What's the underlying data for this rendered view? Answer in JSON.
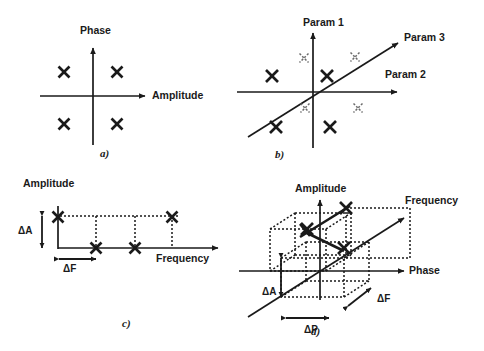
{
  "figure": {
    "width": 484,
    "height": 351,
    "background": "#ffffff",
    "ink_color": "#1a1a1a",
    "faint_color": "#6b6b6b"
  },
  "panels": [
    {
      "id": "a",
      "label": "a)",
      "label_pos": {
        "x": 100,
        "y": 157
      },
      "caption": "Two-dimensional Amplitude-Phase constellation with four bold symbol points",
      "origin": {
        "x": 93,
        "y": 96
      },
      "axes": [
        {
          "name": "horizontal-axis",
          "label": "Amplitude",
          "label_pos": {
            "x": 152,
            "y": 99
          },
          "from": {
            "x": 40,
            "y": 96
          },
          "to": {
            "x": 145,
            "y": 96
          },
          "arrow": true
        },
        {
          "name": "vertical-axis",
          "label": "Phase",
          "label_pos": {
            "x": 80,
            "y": 34
          },
          "from": {
            "x": 93,
            "y": 145
          },
          "to": {
            "x": 93,
            "y": 48
          },
          "arrow": true
        }
      ],
      "markers": [
        {
          "x": 64,
          "y": 72,
          "style": "bold",
          "size": 11
        },
        {
          "x": 117,
          "y": 72,
          "style": "bold",
          "size": 11
        },
        {
          "x": 64,
          "y": 124,
          "style": "bold",
          "size": 11
        },
        {
          "x": 117,
          "y": 124,
          "style": "bold",
          "size": 11
        }
      ]
    },
    {
      "id": "b",
      "label": "b)",
      "label_pos": {
        "x": 275,
        "y": 158
      },
      "caption": "Three-dimensional parameter constellation, four bold points on the near plane and four faint points on the far plane",
      "origin": {
        "x": 313,
        "y": 92
      },
      "axes": [
        {
          "name": "horizontal-axis",
          "label": "Param 2",
          "label_pos": {
            "x": 385,
            "y": 78
          },
          "from": {
            "x": 237,
            "y": 92
          },
          "to": {
            "x": 397,
            "y": 92
          },
          "arrow": true
        },
        {
          "name": "vertical-axis",
          "label": "Param 1",
          "label_pos": {
            "x": 303,
            "y": 26
          },
          "from": {
            "x": 313,
            "y": 148
          },
          "to": {
            "x": 313,
            "y": 33
          },
          "arrow": true
        },
        {
          "name": "diagonal-axis",
          "label": "Param 3",
          "label_pos": {
            "x": 404,
            "y": 41
          },
          "from": {
            "x": 248,
            "y": 137
          },
          "to": {
            "x": 398,
            "y": 43
          },
          "arrow": true
        }
      ],
      "markers": [
        {
          "x": 272,
          "y": 76,
          "style": "bold",
          "size": 12
        },
        {
          "x": 327,
          "y": 76,
          "style": "bold",
          "size": 12
        },
        {
          "x": 276,
          "y": 127,
          "style": "bold",
          "size": 12
        },
        {
          "x": 330,
          "y": 127,
          "style": "bold",
          "size": 12
        },
        {
          "x": 304,
          "y": 58,
          "style": "faint",
          "size": 9
        },
        {
          "x": 355,
          "y": 57,
          "style": "faint",
          "size": 9
        },
        {
          "x": 305,
          "y": 108,
          "style": "faint",
          "size": 9
        },
        {
          "x": 358,
          "y": 108,
          "style": "faint",
          "size": 9
        }
      ]
    },
    {
      "id": "c",
      "label": "c)",
      "label_pos": {
        "x": 122,
        "y": 327
      },
      "caption": "Amplitude versus Frequency hopping pattern with delta-A and delta-F step annotations",
      "origin": {
        "x": 58,
        "y": 248
      },
      "axes": [
        {
          "name": "horizontal-axis",
          "label": "Frequency",
          "label_pos": {
            "x": 156,
            "y": 262
          },
          "from": {
            "x": 58,
            "y": 248
          },
          "to": {
            "x": 218,
            "y": 248
          },
          "arrow": true
        },
        {
          "name": "vertical-axis",
          "label": "Amplitude",
          "label_pos": {
            "x": 23,
            "y": 187
          },
          "from": {
            "x": 58,
            "y": 248
          },
          "to": {
            "x": 58,
            "y": 204
          },
          "arrow": false
        }
      ],
      "markers": [
        {
          "x": 58,
          "y": 217,
          "style": "bold",
          "size": 11
        },
        {
          "x": 96,
          "y": 248,
          "style": "bold",
          "size": 11
        },
        {
          "x": 135,
          "y": 248,
          "style": "bold",
          "size": 11
        },
        {
          "x": 172,
          "y": 217,
          "style": "bold",
          "size": 11
        }
      ],
      "annotations": [
        {
          "name": "delta-a",
          "label": "ΔA",
          "label_pos": {
            "x": 18,
            "y": 234
          },
          "type": "vertical-double-arrow",
          "x": 42,
          "y1": 216,
          "y2": 248
        },
        {
          "name": "delta-f",
          "label": "ΔF",
          "label_pos": {
            "x": 63,
            "y": 272
          },
          "type": "horizontal-double-arrow",
          "y": 259,
          "x1": 59,
          "x2": 96
        }
      ]
    },
    {
      "id": "d",
      "label": "d)",
      "label_pos": {
        "x": 311,
        "y": 335
      },
      "caption": "Three-dimensional Amplitude-Phase-Frequency trajectory with delta-A, delta-P and delta-F step annotations",
      "origin": {
        "x": 320,
        "y": 271
      },
      "axes": [
        {
          "name": "vertical-axis",
          "label": "Amplitude",
          "label_pos": {
            "x": 295,
            "y": 192
          },
          "from": {
            "x": 320,
            "y": 300
          },
          "to": {
            "x": 320,
            "y": 200
          },
          "arrow": true
        },
        {
          "name": "horizontal-axis",
          "label": "Phase",
          "label_pos": {
            "x": 409,
            "y": 274
          },
          "from": {
            "x": 239,
            "y": 271
          },
          "to": {
            "x": 404,
            "y": 271
          },
          "arrow": true
        },
        {
          "name": "diagonal-axis",
          "label": "Frequency",
          "label_pos": {
            "x": 405,
            "y": 204
          },
          "from": {
            "x": 248,
            "y": 317
          },
          "to": {
            "x": 404,
            "y": 218
          },
          "arrow": true
        }
      ],
      "markers": [
        {
          "x": 344,
          "y": 248,
          "style": "bold",
          "size": 12
        },
        {
          "x": 307,
          "y": 229,
          "style": "bold",
          "size": 12
        },
        {
          "x": 346,
          "y": 208,
          "style": "bold",
          "size": 12
        }
      ],
      "annotations": [
        {
          "name": "delta-a",
          "label": "ΔA",
          "label_pos": {
            "x": 262,
            "y": 295
          },
          "type": "vertical-double-arrow",
          "x": 281,
          "y1": 258,
          "y2": 297
        },
        {
          "name": "delta-p",
          "label": "ΔP",
          "label_pos": {
            "x": 304,
            "y": 333
          },
          "type": "horizontal-double-arrow",
          "y": 318,
          "x1": 286,
          "x2": 329
        },
        {
          "name": "delta-f",
          "label": "ΔF",
          "label_pos": {
            "x": 377,
            "y": 302
          },
          "type": "diagonal-double-arrow",
          "x1": 348,
          "y1": 306,
          "x2": 371,
          "y2": 288
        }
      ]
    }
  ]
}
